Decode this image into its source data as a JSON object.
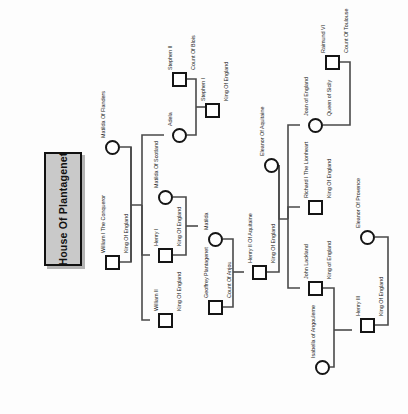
{
  "diagram": {
    "type": "family-tree",
    "title": "House Of Plantagenet",
    "orientation": "rotated-90",
    "node_shapes": {
      "male": "square",
      "female": "circle"
    },
    "people": [
      {
        "id": "matilda_flanders",
        "name": "Matilda Of Flanders",
        "role": "",
        "sex": "female",
        "x": 105,
        "y": 140
      },
      {
        "id": "william_i",
        "name": "William I The Conqueror",
        "role": "King Of England",
        "sex": "male",
        "x": 105,
        "y": 255
      },
      {
        "id": "stephen_ii",
        "name": "Stephen II",
        "role": "Count Of Blois",
        "sex": "male",
        "x": 172,
        "y": 72
      },
      {
        "id": "adela",
        "name": "Adela",
        "role": "",
        "sex": "female",
        "x": 172,
        "y": 128
      },
      {
        "id": "stephen_i",
        "name": "Stephen I",
        "role": "King Of England",
        "sex": "male",
        "x": 205,
        "y": 103
      },
      {
        "id": "matilda_scotland",
        "name": "Matilda Of Scotland",
        "role": "",
        "sex": "female",
        "x": 158,
        "y": 190
      },
      {
        "id": "henry_i",
        "name": "Henry I",
        "role": "King Of England",
        "sex": "male",
        "x": 158,
        "y": 248
      },
      {
        "id": "william_ii",
        "name": "William II",
        "role": "King Of England",
        "sex": "male",
        "x": 158,
        "y": 313
      },
      {
        "id": "matilda",
        "name": "Matilda",
        "role": "",
        "sex": "female",
        "x": 208,
        "y": 232
      },
      {
        "id": "geoffrey",
        "name": "Geoffrey Plantagenet",
        "role": "Count Of Anjou",
        "sex": "male",
        "x": 208,
        "y": 300
      },
      {
        "id": "henry_ii",
        "name": "Henry II Of Aquitaine",
        "role": "King Of England",
        "sex": "male",
        "x": 252,
        "y": 265
      },
      {
        "id": "eleanor_aquitaine",
        "name": "Eleanor Of Aquitaine",
        "role": "",
        "sex": "female",
        "x": 264,
        "y": 158
      },
      {
        "id": "joan",
        "name": "Joan of England",
        "role": "Queen of Sicily",
        "sex": "female",
        "x": 308,
        "y": 118
      },
      {
        "id": "raimund_vi",
        "name": "Raimund VI",
        "role": "Count Of Toulouse",
        "sex": "male",
        "x": 325,
        "y": 55
      },
      {
        "id": "richard_i",
        "name": "Richard I The Lionheart",
        "role": "King Of England",
        "sex": "male",
        "x": 308,
        "y": 200
      },
      {
        "id": "john",
        "name": "John Lackland",
        "role": "King of England",
        "sex": "male",
        "x": 308,
        "y": 281
      },
      {
        "id": "isabella",
        "name": "Isabella of Angouleme",
        "role": "",
        "sex": "female",
        "x": 315,
        "y": 360
      },
      {
        "id": "henry_iii",
        "name": "Henry III",
        "role": "King Of England",
        "sex": "male",
        "x": 360,
        "y": 318
      },
      {
        "id": "eleanor_provence",
        "name": "Eleanor Of Provence",
        "role": "",
        "sex": "female",
        "x": 360,
        "y": 230
      }
    ],
    "unions": [
      {
        "parents": [
          "matilda_flanders",
          "william_i"
        ],
        "children": [
          "adela",
          "henry_i",
          "william_ii"
        ]
      },
      {
        "parents": [
          "stephen_ii",
          "adela"
        ],
        "children": [
          "stephen_i"
        ]
      },
      {
        "parents": [
          "matilda_scotland",
          "henry_i"
        ],
        "children": [
          "matilda"
        ]
      },
      {
        "parents": [
          "matilda",
          "geoffrey"
        ],
        "children": [
          "henry_ii"
        ]
      },
      {
        "parents": [
          "henry_ii",
          "eleanor_aquitaine"
        ],
        "children": [
          "joan",
          "richard_i",
          "john"
        ]
      },
      {
        "parents": [
          "raimund_vi",
          "joan"
        ],
        "children": []
      },
      {
        "parents": [
          "john",
          "isabella"
        ],
        "children": [
          "henry_iii"
        ]
      },
      {
        "parents": [
          "henry_iii",
          "eleanor_provence"
        ],
        "children": []
      }
    ],
    "colors": {
      "stroke": "#151515",
      "wire": "#4a4a4a",
      "plate_fill": "#c9c9c9",
      "plate_border": "#111111",
      "background": "#fdfdfd"
    }
  }
}
